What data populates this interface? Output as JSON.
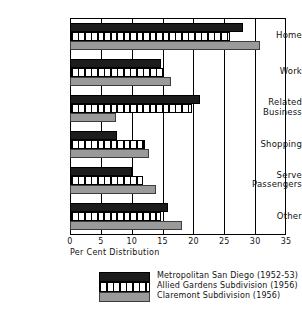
{
  "chart_data": {
    "type": "bar",
    "orientation": "horizontal",
    "title": "",
    "xlabel": "Per Cent Distribution",
    "ylabel": "",
    "xlim": [
      0,
      35
    ],
    "xticks": [
      0,
      5,
      10,
      15,
      20,
      25,
      30,
      35
    ],
    "grid": true,
    "legend_position": "bottom",
    "categories": [
      "Home",
      "Work",
      "Related Business",
      "Shopping",
      "Serve Passengers",
      "Other"
    ],
    "series": [
      {
        "name": "Metropolitan San Diego (1952-53)",
        "style": "solid-black",
        "color": "#1c1c1c",
        "values": [
          28.0,
          14.7,
          21.0,
          7.6,
          10.0,
          15.9
        ]
      },
      {
        "name": "Allied Gardens Subdivision (1956)",
        "style": "vertical-hatch",
        "color": "#ffffff",
        "values": [
          26.0,
          15.0,
          19.7,
          12.1,
          11.9,
          14.8
        ]
      },
      {
        "name": "Claremont Subdivision (1956)",
        "style": "solid-gray",
        "color": "#9a9a9a",
        "values": [
          30.8,
          16.4,
          7.5,
          12.8,
          14.0,
          18.1
        ]
      }
    ]
  },
  "axis": {
    "x_title": "Per Cent Distribution",
    "tick_labels": [
      "0",
      "5",
      "10",
      "15",
      "20",
      "25",
      "30",
      "35"
    ]
  },
  "category_labels": [
    {
      "line1": "Home",
      "line2": ""
    },
    {
      "line1": "Work",
      "line2": ""
    },
    {
      "line1": "Related",
      "line2": "Business"
    },
    {
      "line1": "Shopping",
      "line2": ""
    },
    {
      "line1": "Serve",
      "line2": "Passengers"
    },
    {
      "line1": "Other",
      "line2": ""
    }
  ],
  "legend": {
    "entries": [
      "Metropolitan San Diego (1952-53)",
      "Allied Gardens Subdivision (1956)",
      "Claremont Subdivision (1956)"
    ]
  }
}
